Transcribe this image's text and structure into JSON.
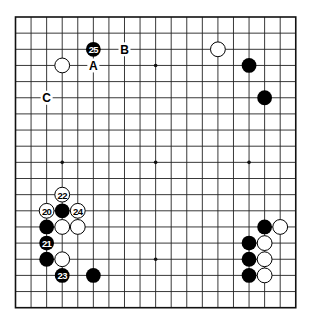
{
  "board": {
    "size": 19,
    "origin_x": 15.5,
    "origin_y": 17,
    "step_x": 15.57,
    "step_y": 16.15,
    "stone_radius": 7.4,
    "colors": {
      "black": "#000000",
      "white": "#ffffff",
      "line": "#222222"
    },
    "star_points": [
      [
        9,
        3
      ],
      [
        3,
        9
      ],
      [
        9,
        9
      ],
      [
        15,
        9
      ],
      [
        9,
        15
      ]
    ],
    "stones": [
      {
        "col": 5,
        "row": 2,
        "color": "black",
        "label": "25"
      },
      {
        "col": 3,
        "row": 3,
        "color": "white",
        "label": ""
      },
      {
        "col": 13,
        "row": 2,
        "color": "white",
        "label": ""
      },
      {
        "col": 15,
        "row": 3,
        "color": "black",
        "label": ""
      },
      {
        "col": 16,
        "row": 5,
        "color": "black",
        "label": ""
      },
      {
        "col": 3,
        "row": 11,
        "color": "white",
        "label": "22"
      },
      {
        "col": 2,
        "row": 12,
        "color": "white",
        "label": "20"
      },
      {
        "col": 3,
        "row": 12,
        "color": "black",
        "label": ""
      },
      {
        "col": 4,
        "row": 12,
        "color": "white",
        "label": "24"
      },
      {
        "col": 2,
        "row": 13,
        "color": "black",
        "label": ""
      },
      {
        "col": 3,
        "row": 13,
        "color": "white",
        "label": ""
      },
      {
        "col": 4,
        "row": 13,
        "color": "white",
        "label": ""
      },
      {
        "col": 2,
        "row": 14,
        "color": "black",
        "label": "21"
      },
      {
        "col": 2,
        "row": 15,
        "color": "black",
        "label": ""
      },
      {
        "col": 3,
        "row": 15,
        "color": "white",
        "label": ""
      },
      {
        "col": 3,
        "row": 16,
        "color": "black",
        "label": "23"
      },
      {
        "col": 5,
        "row": 16,
        "color": "black",
        "label": ""
      },
      {
        "col": 16,
        "row": 13,
        "color": "black",
        "label": ""
      },
      {
        "col": 17,
        "row": 13,
        "color": "white",
        "label": ""
      },
      {
        "col": 15,
        "row": 14,
        "color": "black",
        "label": ""
      },
      {
        "col": 16,
        "row": 14,
        "color": "white",
        "label": ""
      },
      {
        "col": 15,
        "row": 15,
        "color": "black",
        "label": ""
      },
      {
        "col": 16,
        "row": 15,
        "color": "white",
        "label": ""
      },
      {
        "col": 15,
        "row": 16,
        "color": "black",
        "label": ""
      },
      {
        "col": 16,
        "row": 16,
        "color": "white",
        "label": ""
      }
    ],
    "marks": [
      {
        "col": 5,
        "row": 3,
        "label": "A"
      },
      {
        "col": 7,
        "row": 2,
        "label": "B"
      },
      {
        "col": 2,
        "row": 5,
        "label": "C"
      }
    ]
  }
}
